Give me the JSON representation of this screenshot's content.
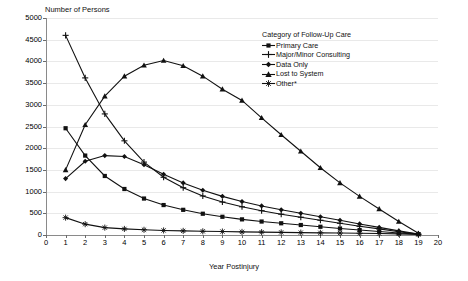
{
  "chart_data": {
    "type": "line",
    "title": "",
    "ylabel": "Number of Persons",
    "xlabel": "Year Postinjury",
    "legend_title": "Category of Follow-Up Care",
    "legend_position": "top-right inside plot",
    "grid": true,
    "xlim": [
      0,
      20
    ],
    "ylim": [
      0,
      5000
    ],
    "ytick_step": 500,
    "xtick_step": 1,
    "x": [
      1,
      2,
      3,
      4,
      5,
      6,
      7,
      8,
      9,
      10,
      11,
      12,
      13,
      14,
      15,
      16,
      17,
      18,
      19
    ],
    "xticks": [
      "0",
      "1",
      "2",
      "3",
      "4",
      "5",
      "6",
      "7",
      "8",
      "9",
      "10",
      "11",
      "12",
      "13",
      "14",
      "15",
      "16",
      "17",
      "18",
      "19",
      "20"
    ],
    "yticks": [
      "0",
      "500",
      "1000",
      "1500",
      "2000",
      "2500",
      "3000",
      "3500",
      "4000",
      "4500",
      "5000"
    ],
    "series": [
      {
        "name": "Primary Care",
        "marker": "square",
        "values": [
          2460,
          1830,
          1360,
          1060,
          840,
          690,
          580,
          490,
          420,
          360,
          310,
          270,
          230,
          190,
          150,
          115,
          80,
          45,
          20
        ]
      },
      {
        "name": "Major/Minor Consulting",
        "marker": "plus",
        "values": [
          4600,
          3620,
          2790,
          2170,
          1680,
          1330,
          1090,
          900,
          760,
          650,
          560,
          480,
          410,
          340,
          270,
          200,
          140,
          75,
          20
        ]
      },
      {
        "name": "Data Only",
        "marker": "diamond",
        "values": [
          1300,
          1700,
          1830,
          1810,
          1620,
          1400,
          1200,
          1030,
          890,
          770,
          670,
          580,
          500,
          420,
          340,
          255,
          175,
          95,
          20
        ]
      },
      {
        "name": "Lost to System",
        "marker": "triangle",
        "values": [
          1500,
          2540,
          3200,
          3660,
          3910,
          4020,
          3900,
          3660,
          3360,
          3100,
          2700,
          2310,
          1930,
          1550,
          1200,
          890,
          600,
          310,
          40
        ]
      },
      {
        "name": "Other*",
        "marker": "star",
        "values": [
          400,
          250,
          170,
          140,
          120,
          105,
          95,
          85,
          80,
          72,
          66,
          60,
          55,
          50,
          45,
          40,
          34,
          26,
          15
        ]
      }
    ]
  }
}
